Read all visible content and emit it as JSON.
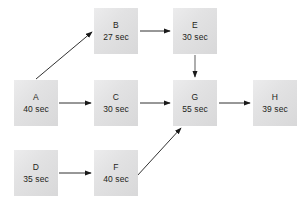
{
  "diagram": {
    "type": "activity-network-diagram",
    "background_color": "#ffffff",
    "node_fill_color": "#e2e2e3",
    "text_color": "#231f20",
    "edge_color": "#1a1a1a",
    "nodes": [
      {
        "key": "A",
        "id": "A",
        "duration": "40 sec",
        "x": 14,
        "y": 80
      },
      {
        "key": "B",
        "id": "B",
        "duration": "27 sec",
        "x": 94,
        "y": 8
      },
      {
        "key": "C",
        "id": "C",
        "duration": "30 sec",
        "x": 94,
        "y": 80
      },
      {
        "key": "D",
        "id": "D",
        "duration": "35 sec",
        "x": 14,
        "y": 150
      },
      {
        "key": "E",
        "id": "E",
        "duration": "30 sec",
        "x": 173,
        "y": 8
      },
      {
        "key": "F",
        "id": "F",
        "duration": "40 sec",
        "x": 94,
        "y": 150
      },
      {
        "key": "G",
        "id": "G",
        "duration": "55 sec",
        "x": 173,
        "y": 80
      },
      {
        "key": "H",
        "id": "H",
        "duration": "39 sec",
        "x": 253,
        "y": 80
      }
    ],
    "edges": [
      {
        "key": "A-B",
        "from": "A",
        "to": "B",
        "style": "diagonal-up"
      },
      {
        "key": "A-C",
        "from": "A",
        "to": "C",
        "style": "horizontal"
      },
      {
        "key": "B-E",
        "from": "B",
        "to": "E",
        "style": "horizontal"
      },
      {
        "key": "C-G",
        "from": "C",
        "to": "G",
        "style": "horizontal"
      },
      {
        "key": "D-F",
        "from": "D",
        "to": "F",
        "style": "horizontal"
      },
      {
        "key": "E-G",
        "from": "E",
        "to": "G",
        "style": "vertical-down"
      },
      {
        "key": "F-G",
        "from": "F",
        "to": "G",
        "style": "diagonal-up"
      },
      {
        "key": "G-H",
        "from": "G",
        "to": "H",
        "style": "horizontal"
      }
    ]
  }
}
